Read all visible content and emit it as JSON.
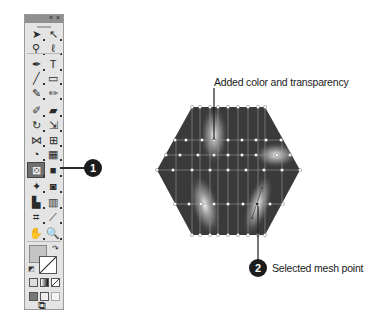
{
  "toolbar": {
    "header_collapse": "«",
    "header_close": "×",
    "tools": [
      {
        "name": "selection-tool",
        "glyph": "➤",
        "col": 0,
        "row": 0
      },
      {
        "name": "direct-selection-tool",
        "glyph": "↖",
        "col": 1,
        "row": 0
      },
      {
        "name": "magic-wand-tool",
        "glyph": "⚲",
        "col": 0,
        "row": 1
      },
      {
        "name": "lasso-tool",
        "glyph": "ℓ",
        "col": 1,
        "row": 1
      },
      {
        "name": "pen-tool",
        "glyph": "✒",
        "col": 0,
        "row": 2
      },
      {
        "name": "type-tool",
        "glyph": "T",
        "col": 1,
        "row": 2
      },
      {
        "name": "line-segment-tool",
        "glyph": "╱",
        "col": 0,
        "row": 3
      },
      {
        "name": "rectangle-tool",
        "glyph": "▭",
        "col": 1,
        "row": 3
      },
      {
        "name": "paintbrush-tool",
        "glyph": "✎",
        "col": 0,
        "row": 4
      },
      {
        "name": "pencil-tool",
        "glyph": "✏",
        "col": 1,
        "row": 4
      },
      {
        "name": "blob-brush-tool",
        "glyph": "✐",
        "col": 0,
        "row": 5
      },
      {
        "name": "eraser-tool",
        "glyph": "▰",
        "col": 1,
        "row": 5
      },
      {
        "name": "rotate-tool",
        "glyph": "↻",
        "col": 0,
        "row": 6
      },
      {
        "name": "scale-tool",
        "glyph": "⇲",
        "col": 1,
        "row": 6
      },
      {
        "name": "width-tool",
        "glyph": "⋈",
        "col": 0,
        "row": 7
      },
      {
        "name": "free-transform-tool",
        "glyph": "⊞",
        "col": 1,
        "row": 7
      },
      {
        "name": "shape-builder-tool",
        "glyph": "◔",
        "col": 0,
        "row": 8
      },
      {
        "name": "perspective-grid-tool",
        "glyph": "▦",
        "col": 1,
        "row": 8
      },
      {
        "name": "mesh-tool",
        "glyph": "⊠",
        "col": 0,
        "row": 9,
        "selected": true
      },
      {
        "name": "gradient-tool",
        "glyph": "■",
        "col": 1,
        "row": 9
      },
      {
        "name": "eyedropper-tool",
        "glyph": "✦",
        "col": 0,
        "row": 10
      },
      {
        "name": "blend-tool",
        "glyph": "◙",
        "col": 1,
        "row": 10
      },
      {
        "name": "symbol-sprayer-tool",
        "glyph": "▙",
        "col": 0,
        "row": 11
      },
      {
        "name": "column-graph-tool",
        "glyph": "▥",
        "col": 1,
        "row": 11
      },
      {
        "name": "artboard-tool",
        "glyph": "⌗",
        "col": 0,
        "row": 12
      },
      {
        "name": "slice-tool",
        "glyph": "⟋",
        "col": 1,
        "row": 12
      },
      {
        "name": "hand-tool",
        "glyph": "✋",
        "col": 0,
        "row": 13
      },
      {
        "name": "zoom-tool",
        "glyph": "🔍",
        "col": 1,
        "row": 13
      }
    ],
    "fill_color": "#c4c4c4",
    "stroke_color": "none",
    "color_modes": [
      "color",
      "gradient",
      "none"
    ],
    "draw_modes": [
      "draw-normal",
      "draw-behind",
      "draw-inside"
    ],
    "screen_mode_glyph": "⧉"
  },
  "callouts": [
    {
      "number": "1",
      "target": "mesh-tool"
    },
    {
      "number": "2",
      "label": "Selected mesh point"
    }
  ],
  "annotations": {
    "top_label": "Added color and transparency",
    "bottom_label": "Selected mesh point"
  },
  "artwork": {
    "shape": "hexagon-gradient-mesh",
    "base_color": "#3a3a3a",
    "highlight_color": "#e8e8e8",
    "mesh_line_color": "#b0b0b0",
    "mesh_point_color": "#ffffff"
  }
}
